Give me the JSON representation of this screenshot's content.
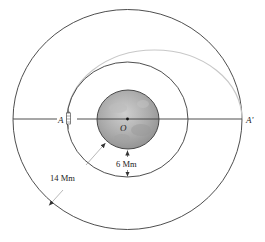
{
  "diagram": {
    "type": "orbital-transfer",
    "labels": {
      "start_point": "A",
      "end_point": "A'",
      "center": "O",
      "inner_gap": "6 Mm",
      "outer_radius": "14 Mm"
    },
    "colors": {
      "stroke": "#3a3a3a",
      "transfer_orbit": "#c8c8c8",
      "planet_light": "#c9c9c9",
      "planet_mid": "#a9a9a9",
      "planet_dark": "#8e8e8e",
      "background": "#ffffff"
    },
    "elements": [
      {
        "name": "outer-orbit",
        "description": "outer circular orbit through A'"
      },
      {
        "name": "inner-orbit",
        "description": "inner circular orbit through A"
      },
      {
        "name": "planet",
        "description": "central planet with center O"
      },
      {
        "name": "transfer-orbit",
        "description": "gray elliptical transfer path from A to A'"
      },
      {
        "name": "spacecraft",
        "description": "spacecraft at point A"
      },
      {
        "name": "dimension-6mm",
        "description": "vertical dimension from planet surface to inner orbit"
      },
      {
        "name": "dimension-14mm",
        "description": "diagonal dimension from planet surface to outer orbit"
      }
    ]
  }
}
